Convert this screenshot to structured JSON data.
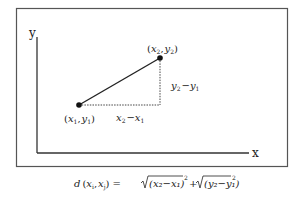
{
  "diagram": {
    "axes": {
      "x_label": "x",
      "y_label": "y"
    },
    "points": [
      {
        "id": "p1",
        "label_open": "(",
        "label_var1": "x",
        "label_sub1": "1",
        "label_comma": ",",
        "label_var2": "y",
        "label_sub2": "1",
        "label_close": ")"
      },
      {
        "id": "p2",
        "label_open": "(",
        "label_var1": "x",
        "label_sub1": "2",
        "label_comma": ",",
        "label_var2": "y",
        "label_sub2": "2",
        "label_close": ")"
      }
    ],
    "delta_x": {
      "a": "x",
      "a_sub": "2",
      "op": "−",
      "b": "x",
      "b_sub": "1"
    },
    "delta_y": {
      "a": "y",
      "a_sub": "2",
      "op": "−",
      "b": "y",
      "b_sub": "1"
    },
    "formula": {
      "lhs": "d",
      "lhs_args_open": "(",
      "arg1": "x",
      "arg1_sub": "i",
      "arg_sep": ",",
      "arg2": "x",
      "arg2_sub": "j",
      "lhs_args_close": ")",
      "equals": "=",
      "term1": "(x₂−x₁)",
      "term1_exp": "2",
      "plus": "+",
      "term2": "(y₂−y₁)",
      "term2_exp": "2"
    },
    "colors": {
      "line": "#222222",
      "frame": "#555555",
      "point": "#111111"
    }
  }
}
